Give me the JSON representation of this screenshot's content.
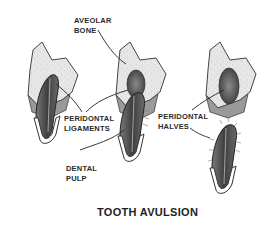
{
  "diagram": {
    "title": "TOOTH AVULSION",
    "labels": {
      "aveolar_bone": [
        "AVEOLAR",
        "BONE"
      ],
      "peridontal_ligaments": [
        "PERIDONTAL",
        "LIGAMENTS"
      ],
      "dental_pulp": [
        "DENTAL",
        "PULP"
      ],
      "peridontal_halves": [
        "PERIDONTAL",
        "HALVES"
      ]
    },
    "panels": [
      {
        "stage": "tooth in socket"
      },
      {
        "stage": "tooth partially displaced"
      },
      {
        "stage": "tooth fully avulsed"
      }
    ],
    "colors": {
      "bone": "#e4e4e4",
      "tooth_dark": "#555555",
      "ink": "#2a2a2a",
      "background": "#ffffff"
    }
  }
}
